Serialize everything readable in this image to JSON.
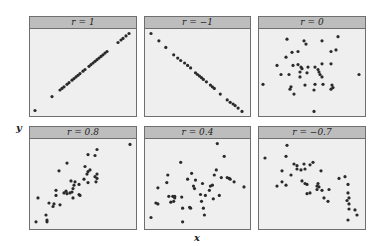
{
  "chart_data": {
    "type": "scatter",
    "layout": {
      "rows": 2,
      "cols": 3,
      "grid": false
    },
    "xlabel": "x",
    "ylabel": "y",
    "panels": [
      {
        "title": "r = 1",
        "r": 1,
        "points": [
          [
            0.02,
            0.03
          ],
          [
            0.19,
            0.2
          ],
          [
            0.27,
            0.28
          ],
          [
            0.29,
            0.3
          ],
          [
            0.31,
            0.32
          ],
          [
            0.34,
            0.35
          ],
          [
            0.36,
            0.37
          ],
          [
            0.39,
            0.4
          ],
          [
            0.41,
            0.42
          ],
          [
            0.43,
            0.44
          ],
          [
            0.45,
            0.46
          ],
          [
            0.47,
            0.48
          ],
          [
            0.5,
            0.51
          ],
          [
            0.52,
            0.53
          ],
          [
            0.56,
            0.57
          ],
          [
            0.58,
            0.59
          ],
          [
            0.6,
            0.61
          ],
          [
            0.62,
            0.63
          ],
          [
            0.64,
            0.65
          ],
          [
            0.66,
            0.67
          ],
          [
            0.68,
            0.69
          ],
          [
            0.7,
            0.71
          ],
          [
            0.72,
            0.73
          ],
          [
            0.74,
            0.75
          ],
          [
            0.85,
            0.86
          ],
          [
            0.88,
            0.89
          ],
          [
            0.9,
            0.91
          ],
          [
            0.93,
            0.94
          ],
          [
            0.96,
            0.97
          ]
        ]
      },
      {
        "title": "r = −1",
        "r": -1,
        "points": [
          [
            0.03,
            0.97
          ],
          [
            0.11,
            0.88
          ],
          [
            0.18,
            0.8
          ],
          [
            0.26,
            0.71
          ],
          [
            0.3,
            0.67
          ],
          [
            0.33,
            0.64
          ],
          [
            0.37,
            0.61
          ],
          [
            0.4,
            0.58
          ],
          [
            0.43,
            0.55
          ],
          [
            0.48,
            0.49
          ],
          [
            0.5,
            0.47
          ],
          [
            0.52,
            0.45
          ],
          [
            0.54,
            0.43
          ],
          [
            0.56,
            0.41
          ],
          [
            0.59,
            0.38
          ],
          [
            0.63,
            0.34
          ],
          [
            0.65,
            0.32
          ],
          [
            0.67,
            0.3
          ],
          [
            0.73,
            0.23
          ],
          [
            0.8,
            0.16
          ],
          [
            0.83,
            0.13
          ],
          [
            0.86,
            0.11
          ],
          [
            0.88,
            0.09
          ],
          [
            0.91,
            0.06
          ],
          [
            0.95,
            0.02
          ]
        ]
      },
      {
        "title": "r = 0",
        "r": 0,
        "points": [
          [
            0.25,
            0.9
          ],
          [
            0.42,
            0.88
          ],
          [
            0.44,
            0.84
          ],
          [
            0.6,
            0.88
          ],
          [
            0.76,
            0.93
          ],
          [
            0.69,
            0.75
          ],
          [
            0.74,
            0.77
          ],
          [
            0.3,
            0.74
          ],
          [
            0.36,
            0.75
          ],
          [
            0.24,
            0.68
          ],
          [
            0.15,
            0.58
          ],
          [
            0.31,
            0.58
          ],
          [
            0.36,
            0.59
          ],
          [
            0.39,
            0.56
          ],
          [
            0.4,
            0.54
          ],
          [
            0.46,
            0.56
          ],
          [
            0.53,
            0.56
          ],
          [
            0.56,
            0.53
          ],
          [
            0.6,
            0.6
          ],
          [
            0.69,
            0.6
          ],
          [
            0.19,
            0.47
          ],
          [
            0.27,
            0.47
          ],
          [
            0.38,
            0.5
          ],
          [
            0.38,
            0.44
          ],
          [
            0.45,
            0.49
          ],
          [
            0.57,
            0.5
          ],
          [
            0.58,
            0.47
          ],
          [
            0.6,
            0.44
          ],
          [
            0.01,
            0.35
          ],
          [
            0.29,
            0.32
          ],
          [
            0.28,
            0.29
          ],
          [
            0.43,
            0.34
          ],
          [
            0.53,
            0.35
          ],
          [
            0.61,
            0.35
          ],
          [
            0.7,
            0.34
          ],
          [
            0.71,
            0.31
          ],
          [
            0.69,
            0.29
          ],
          [
            0.52,
            0.28
          ],
          [
            0.32,
            0.23
          ],
          [
            0.52,
            0.02
          ],
          [
            0.97,
            0.47
          ]
        ]
      },
      {
        "title": "r = 0.8",
        "r": 0.8,
        "points": [
          [
            0.03,
            0.05
          ],
          [
            0.14,
            0.05
          ],
          [
            0.14,
            0.07
          ],
          [
            0.13,
            0.13
          ],
          [
            0.05,
            0.33
          ],
          [
            0.16,
            0.27
          ],
          [
            0.2,
            0.23
          ],
          [
            0.21,
            0.26
          ],
          [
            0.27,
            0.25
          ],
          [
            0.23,
            0.36
          ],
          [
            0.23,
            0.42
          ],
          [
            0.31,
            0.39
          ],
          [
            0.33,
            0.41
          ],
          [
            0.34,
            0.38
          ],
          [
            0.37,
            0.39
          ],
          [
            0.39,
            0.4
          ],
          [
            0.4,
            0.44
          ],
          [
            0.41,
            0.48
          ],
          [
            0.42,
            0.52
          ],
          [
            0.38,
            0.53
          ],
          [
            0.4,
            0.33
          ],
          [
            0.46,
            0.37
          ],
          [
            0.47,
            0.36
          ],
          [
            0.46,
            0.49
          ],
          [
            0.51,
            0.55
          ],
          [
            0.54,
            0.61
          ],
          [
            0.55,
            0.64
          ],
          [
            0.57,
            0.66
          ],
          [
            0.52,
            0.7
          ],
          [
            0.55,
            0.51
          ],
          [
            0.62,
            0.58
          ],
          [
            0.63,
            0.52
          ],
          [
            0.64,
            0.56
          ],
          [
            0.64,
            0.61
          ],
          [
            0.26,
            0.65
          ],
          [
            0.34,
            0.74
          ],
          [
            0.55,
            0.84
          ],
          [
            0.62,
            0.83
          ],
          [
            0.64,
            0.9
          ],
          [
            0.97,
            0.96
          ]
        ]
      },
      {
        "title": "r = 0.4",
        "r": 0.4,
        "points": [
          [
            0.03,
            0.1
          ],
          [
            0.08,
            0.27
          ],
          [
            0.1,
            0.26
          ],
          [
            0.1,
            0.45
          ],
          [
            0.19,
            0.51
          ],
          [
            0.2,
            0.6
          ],
          [
            0.21,
            0.35
          ],
          [
            0.25,
            0.35
          ],
          [
            0.23,
            0.28
          ],
          [
            0.26,
            0.29
          ],
          [
            0.27,
            0.35
          ],
          [
            0.27,
            0.33
          ],
          [
            0.33,
            0.75
          ],
          [
            0.34,
            0.34
          ],
          [
            0.35,
            0.21
          ],
          [
            0.35,
            0.05
          ],
          [
            0.4,
            0.55
          ],
          [
            0.42,
            0.22
          ],
          [
            0.43,
            0.21
          ],
          [
            0.44,
            0.62
          ],
          [
            0.46,
            0.47
          ],
          [
            0.47,
            0.44
          ],
          [
            0.48,
            0.54
          ],
          [
            0.53,
            0.37
          ],
          [
            0.54,
            0.29
          ],
          [
            0.55,
            0.5
          ],
          [
            0.56,
            0.21
          ],
          [
            0.57,
            0.13
          ],
          [
            0.58,
            0.36
          ],
          [
            0.62,
            0.42
          ],
          [
            0.63,
            0.47
          ],
          [
            0.65,
            0.48
          ],
          [
            0.66,
            0.32
          ],
          [
            0.67,
            0.6
          ],
          [
            0.69,
            0.66
          ],
          [
            0.7,
            0.97
          ],
          [
            0.72,
            0.36
          ],
          [
            0.74,
            0.57
          ],
          [
            0.77,
            0.82
          ],
          [
            0.8,
            0.57
          ],
          [
            0.82,
            0.56
          ],
          [
            0.83,
            0.55
          ],
          [
            0.87,
            0.52
          ],
          [
            0.97,
            0.46
          ]
        ]
      },
      {
        "title": "r = −0.7",
        "r": -0.7,
        "points": [
          [
            0.03,
            0.8
          ],
          [
            0.25,
            0.95
          ],
          [
            0.24,
            0.82
          ],
          [
            0.32,
            0.73
          ],
          [
            0.35,
            0.71
          ],
          [
            0.35,
            0.67
          ],
          [
            0.39,
            0.66
          ],
          [
            0.42,
            0.73
          ],
          [
            0.43,
            0.67
          ],
          [
            0.48,
            0.72
          ],
          [
            0.51,
            0.75
          ],
          [
            0.2,
            0.65
          ],
          [
            0.2,
            0.52
          ],
          [
            0.15,
            0.47
          ],
          [
            0.24,
            0.48
          ],
          [
            0.29,
            0.6
          ],
          [
            0.4,
            0.53
          ],
          [
            0.43,
            0.5
          ],
          [
            0.45,
            0.49
          ],
          [
            0.55,
            0.47
          ],
          [
            0.56,
            0.5
          ],
          [
            0.55,
            0.43
          ],
          [
            0.57,
            0.46
          ],
          [
            0.6,
            0.42
          ],
          [
            0.67,
            0.43
          ],
          [
            0.45,
            0.38
          ],
          [
            0.48,
            0.39
          ],
          [
            0.59,
            0.65
          ],
          [
            0.62,
            0.33
          ],
          [
            0.66,
            0.29
          ],
          [
            0.77,
            0.56
          ],
          [
            0.83,
            0.58
          ],
          [
            0.86,
            0.49
          ],
          [
            0.86,
            0.39
          ],
          [
            0.87,
            0.33
          ],
          [
            0.85,
            0.3
          ],
          [
            0.87,
            0.26
          ],
          [
            0.87,
            0.2
          ],
          [
            0.93,
            0.19
          ],
          [
            0.95,
            0.13
          ],
          [
            0.86,
            0.07
          ]
        ]
      }
    ]
  }
}
